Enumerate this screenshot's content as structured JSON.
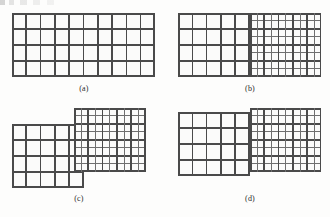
{
  "figure": {
    "kind": "block-structured-grid-diagram",
    "panel_count": 4,
    "line_color_coarse": "#4a4a4a",
    "line_color_fine": "#6f6f6f",
    "cell_fill": "#fbfbfa",
    "page_background": "#fdfdfc"
  },
  "panels": [
    {
      "id": "a",
      "caption": "(a)",
      "description": "single uniform coarse grid",
      "blocks": [
        {
          "name": "coarse-grid",
          "type": "coarse",
          "left": 12,
          "top": 13,
          "width": 143,
          "height": 64,
          "cols": 10,
          "rows": 4,
          "cell_w": 14.3,
          "cell_h": 16.0
        }
      ]
    },
    {
      "id": "b",
      "caption": "(b)",
      "description": "coarse block abutting a conforming 2x refined block, edges aligned",
      "blocks": [
        {
          "name": "coarse-grid",
          "type": "coarse",
          "left": 178,
          "top": 13,
          "width": 71.5,
          "height": 64,
          "cols": 5,
          "rows": 4,
          "cell_w": 14.3,
          "cell_h": 16.0
        },
        {
          "name": "refined-grid",
          "type": "refined",
          "left": 249.5,
          "top": 13,
          "width": 71.5,
          "height": 64,
          "cols": 10,
          "rows": 8,
          "cell_w": 7.15,
          "cell_h": 8.0,
          "coarse_cols": 5,
          "coarse_rows": 4
        }
      ]
    },
    {
      "id": "c",
      "caption": "(c)",
      "description": "coarse block and refined block staggered, refined block shifted upward, non-matching interface",
      "blocks": [
        {
          "name": "coarse-grid",
          "type": "coarse",
          "left": 12,
          "top": 124,
          "width": 71.5,
          "height": 64,
          "cols": 5,
          "rows": 4,
          "cell_w": 14.3,
          "cell_h": 16.0
        },
        {
          "name": "refined-grid",
          "type": "refined",
          "left": 74,
          "top": 108,
          "width": 71.5,
          "height": 64,
          "cols": 10,
          "rows": 8,
          "cell_w": 7.15,
          "cell_h": 8.0,
          "coarse_cols": 5,
          "coarse_rows": 4
        }
      ]
    },
    {
      "id": "d",
      "caption": "(d)",
      "description": "coarse block and refined block abutting with a small vertical offset at the interface",
      "blocks": [
        {
          "name": "coarse-grid",
          "type": "coarse",
          "left": 178,
          "top": 112,
          "width": 71.5,
          "height": 64,
          "cols": 5,
          "rows": 4,
          "cell_w": 14.3,
          "cell_h": 16.0
        },
        {
          "name": "refined-grid",
          "type": "refined",
          "left": 249.5,
          "top": 108,
          "width": 71.5,
          "height": 64,
          "cols": 10,
          "rows": 8,
          "cell_w": 7.15,
          "cell_h": 8.0,
          "coarse_cols": 5,
          "coarse_rows": 4
        }
      ]
    }
  ],
  "captions": {
    "a": "(a)",
    "b": "(b)",
    "c": "(c)",
    "d": "(d)"
  },
  "caption_positions": [
    {
      "id": "a",
      "left": 64,
      "top": 84
    },
    {
      "id": "b",
      "left": 230,
      "top": 84
    },
    {
      "id": "c",
      "left": 59,
      "top": 194
    },
    {
      "id": "d",
      "left": 230,
      "top": 194
    }
  ]
}
